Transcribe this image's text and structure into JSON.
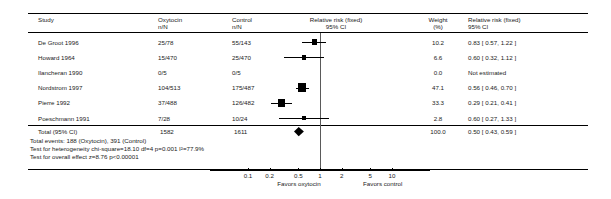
{
  "columns": {
    "study": "Study",
    "exposure_line1": "Oxytocin",
    "exposure_line2": "n/N",
    "control_line1": "Control",
    "control_line2": "n/N",
    "plot_line1": "Relative risk (fixed)",
    "plot_line2": "95% CI",
    "weight_line1": "Weight",
    "weight_line2": "(%)",
    "effect_line1": "Relative risk (fixed)",
    "effect_line2": "95% CI"
  },
  "rows": [
    {
      "study": "De Groot 1996",
      "treat": "25/78",
      "control": "55/143",
      "weight": "10.2",
      "effect": "0.83  [ 0.57,  1.22 ]",
      "rr": 0.83,
      "lo": 0.57,
      "hi": 1.22,
      "estimated": true
    },
    {
      "study": "Howard 1964",
      "treat": "15/470",
      "control": "25/470",
      "weight": "6.6",
      "effect": "0.60  [ 0.32,  1.12 ]",
      "rr": 0.6,
      "lo": 0.32,
      "hi": 1.12,
      "estimated": true
    },
    {
      "study": "Ilancheran 1990",
      "treat": "0/5",
      "control": "0/5",
      "weight": "0.0",
      "effect": "Not estimated",
      "rr": null,
      "lo": null,
      "hi": null,
      "estimated": false
    },
    {
      "study": "Nordstrom 1997",
      "treat": "104/513",
      "control": "175/487",
      "weight": "47.1",
      "effect": "0.56  [ 0.46,  0.70 ]",
      "rr": 0.56,
      "lo": 0.46,
      "hi": 0.7,
      "estimated": true
    },
    {
      "study": "Pierre 1992",
      "treat": "37/488",
      "control": "126/482",
      "weight": "33.3",
      "effect": "0.29  [ 0.21,  0.41 ]",
      "rr": 0.29,
      "lo": 0.21,
      "hi": 0.41,
      "estimated": true
    },
    {
      "study": "Poeschmann 1991",
      "treat": "7/28",
      "control": "10/24",
      "weight": "2.8",
      "effect": "0.60  [ 0.27,  1.33 ]",
      "rr": 0.6,
      "lo": 0.27,
      "hi": 1.33,
      "estimated": true
    }
  ],
  "total": {
    "label": "Total (95% CI)",
    "treat_total": "1582",
    "control_total": "1611",
    "weight": "100.0",
    "effect": "0.50  [ 0.43,  0.59 ]",
    "rr": 0.5,
    "lo": 0.43,
    "hi": 0.59,
    "events_line": "Total events: 188 (Oxytocin), 391 (Control)",
    "heterogeneity_line": "Test for heterogeneity chi-square=18.10 df=4 p=0.001 I²=77.9%",
    "overall_effect_line": "Test for overall effect z=8.76 p<0.00001"
  },
  "axis": {
    "ticks": [
      "0.1",
      "0.2",
      "0.5",
      "1",
      "2",
      "5",
      "10"
    ],
    "tick_values": [
      0.1,
      0.2,
      0.5,
      1,
      2,
      5,
      10
    ],
    "min": 0.1,
    "max": 10,
    "left_label": "Favors oxytocin",
    "right_label": "Favors control",
    "scale": "log"
  },
  "chart_data": {
    "type": "forest",
    "title": "",
    "xlabel": "Relative risk (fixed) 95% CI",
    "ylabel": "",
    "xscale": "log",
    "xlim": [
      0.1,
      10
    ],
    "xticks": [
      0.1,
      0.2,
      0.5,
      1,
      2,
      5,
      10
    ],
    "xticklabels": [
      "0.1",
      "0.2",
      "0.5",
      "1",
      "2",
      "5",
      "10"
    ],
    "null_line": 1,
    "left_annotation": "Favors oxytocin",
    "right_annotation": "Favors control",
    "model": "fixed",
    "measure": "Relative risk",
    "studies": [
      {
        "name": "De Groot 1996",
        "treat_events": 25,
        "treat_n": 78,
        "control_events": 55,
        "control_n": 143,
        "weight_pct": 10.2,
        "rr": 0.83,
        "ci_low": 0.57,
        "ci_high": 1.22
      },
      {
        "name": "Howard 1964",
        "treat_events": 15,
        "treat_n": 470,
        "control_events": 25,
        "control_n": 470,
        "weight_pct": 6.6,
        "rr": 0.6,
        "ci_low": 0.32,
        "ci_high": 1.12
      },
      {
        "name": "Ilancheran 1990",
        "treat_events": 0,
        "treat_n": 5,
        "control_events": 0,
        "control_n": 5,
        "weight_pct": 0.0,
        "rr": null,
        "ci_low": null,
        "ci_high": null
      },
      {
        "name": "Nordstrom 1997",
        "treat_events": 104,
        "treat_n": 513,
        "control_events": 175,
        "control_n": 487,
        "weight_pct": 47.1,
        "rr": 0.56,
        "ci_low": 0.46,
        "ci_high": 0.7
      },
      {
        "name": "Pierre 1992",
        "treat_events": 37,
        "treat_n": 488,
        "control_events": 126,
        "control_n": 482,
        "weight_pct": 33.3,
        "rr": 0.29,
        "ci_low": 0.21,
        "ci_high": 0.41
      },
      {
        "name": "Poeschmann 1991",
        "treat_events": 7,
        "treat_n": 28,
        "control_events": 10,
        "control_n": 24,
        "weight_pct": 2.8,
        "rr": 0.6,
        "ci_low": 0.27,
        "ci_high": 1.33
      }
    ],
    "pooled": {
      "label": "Total (95% CI)",
      "treat_n": 1582,
      "control_n": 1611,
      "weight_pct": 100.0,
      "rr": 0.5,
      "ci_low": 0.43,
      "ci_high": 0.59
    },
    "total_events_treat": 188,
    "total_events_control": 391,
    "heterogeneity": {
      "chi_square": 18.1,
      "df": 4,
      "p": 0.001,
      "i_squared_pct": 77.9
    },
    "overall_effect": {
      "z": 8.76,
      "p": "<0.00001"
    }
  }
}
